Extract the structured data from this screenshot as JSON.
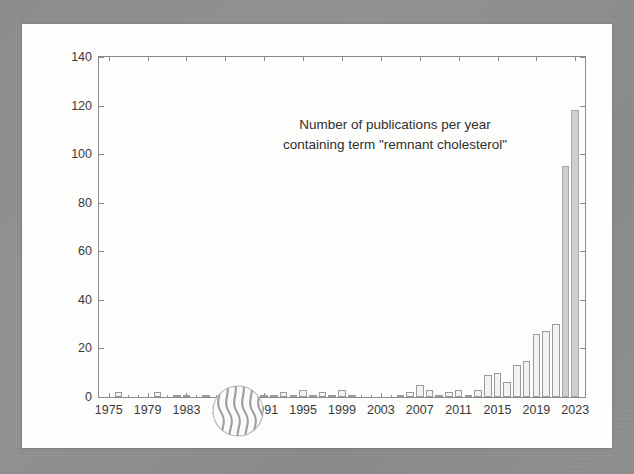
{
  "figure": {
    "title_line1": "Number of publications per year",
    "title_line2": "containing term \"remnant cholesterol\"",
    "logo_name": "wavy-stripes-circle-logo",
    "frame_color": "#8f8f8f",
    "card_color": "#fdfdfc",
    "axis_color": "#8a8a8a",
    "bar_fill": "#f2f2f2",
    "bar_fill_tall": "#cfcfcf",
    "bar_edge": "#9b9b9b"
  },
  "chart_data": {
    "type": "bar",
    "title": "Number of publications per year containing term \"remnant cholesterol\"",
    "xlabel": "",
    "ylabel": "",
    "xlim": [
      1974,
      2024
    ],
    "ylim": [
      0,
      140
    ],
    "ytick_step": 20,
    "yticks": [
      0,
      20,
      40,
      60,
      80,
      100,
      120,
      140
    ],
    "xticks": [
      1975,
      1979,
      1983,
      1987,
      1991,
      1995,
      1999,
      2003,
      2007,
      2011,
      2015,
      2019,
      2023
    ],
    "xtick_labels": [
      "1975",
      "1979",
      "1983",
      "1987",
      "1991",
      "1995",
      "1999",
      "2003",
      "2007",
      "2011",
      "2015",
      "2019",
      "2023"
    ],
    "grid": false,
    "legend": false,
    "categories": [
      1975,
      1976,
      1977,
      1978,
      1979,
      1980,
      1981,
      1982,
      1983,
      1984,
      1985,
      1986,
      1987,
      1988,
      1989,
      1990,
      1991,
      1992,
      1993,
      1994,
      1995,
      1996,
      1997,
      1998,
      1999,
      2000,
      2001,
      2002,
      2003,
      2004,
      2005,
      2006,
      2007,
      2008,
      2009,
      2010,
      2011,
      2012,
      2013,
      2014,
      2015,
      2016,
      2017,
      2018,
      2019,
      2020,
      2021,
      2022,
      2023
    ],
    "values": [
      0,
      2,
      0,
      0,
      0,
      2,
      0,
      1,
      1,
      0,
      1,
      0,
      1,
      0,
      0,
      0,
      1,
      1,
      2,
      1,
      3,
      1,
      2,
      1,
      3,
      1,
      0,
      0,
      0,
      0,
      1,
      2,
      5,
      3,
      1,
      2,
      3,
      1,
      3,
      9,
      10,
      6,
      13,
      15,
      26,
      27,
      30,
      42,
      118
    ],
    "annotations": [
      {
        "kind": "peak",
        "year": 2023,
        "value": 118
      },
      {
        "kind": "second",
        "year": 2022,
        "value": 95
      }
    ],
    "overlay_bars": [
      {
        "year": 2022,
        "value": 95,
        "note": "filled gray bar partially behind 2023"
      }
    ]
  }
}
